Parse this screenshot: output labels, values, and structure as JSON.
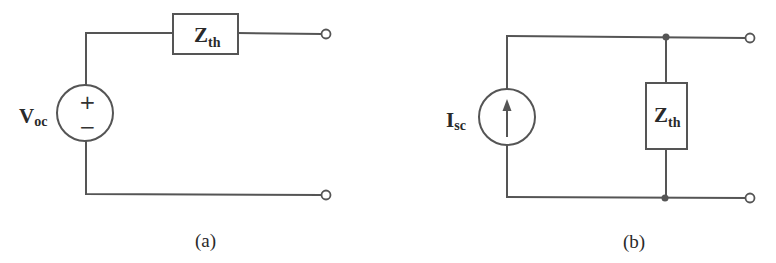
{
  "figure": {
    "panels": [
      {
        "id": "a",
        "caption": "(a)",
        "description": "Thevenin equivalent circuit",
        "source": {
          "type": "voltage-source",
          "label_main": "V",
          "label_sub": "oc",
          "plus_sign": "+",
          "minus_sign": "−"
        },
        "impedance": {
          "label_main": "Z",
          "label_sub": "th",
          "orientation": "series-horizontal"
        },
        "terminals": 2
      },
      {
        "id": "b",
        "caption": "(b)",
        "description": "Norton equivalent circuit",
        "source": {
          "type": "current-source",
          "label_main": "I",
          "label_sub": "sc",
          "arrow_direction": "up"
        },
        "impedance": {
          "label_main": "Z",
          "label_sub": "th",
          "orientation": "parallel-vertical"
        },
        "terminals": 2,
        "junction_nodes": 2
      }
    ],
    "colors": {
      "line": "#555555",
      "text": "#2a2a2a",
      "background": "#ffffff"
    }
  }
}
